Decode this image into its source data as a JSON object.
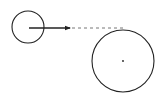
{
  "diagram": {
    "stroke_color": "#222222",
    "dash_color": "#777777",
    "background": "#ffffff",
    "small_circle": {
      "cx": 28,
      "cy": 27,
      "r": 16
    },
    "arrow": {
      "x1": 29,
      "y1": 28,
      "x2": 70,
      "y2": 28
    },
    "dashed_line": {
      "x1": 72,
      "y1": 28,
      "x2": 124,
      "y2": 28
    },
    "large_circle": {
      "cx": 123,
      "cy": 61,
      "r": 31
    },
    "center_dot": {
      "cx": 123,
      "cy": 61,
      "r": 0.9
    }
  }
}
